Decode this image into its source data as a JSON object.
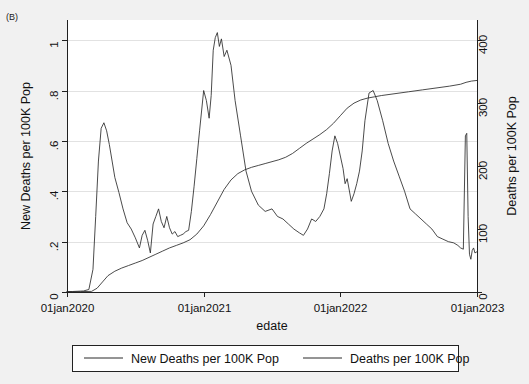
{
  "panel": {
    "tag": "(B)"
  },
  "colors": {
    "background": "#f1f1f1",
    "plot_area": "#ffffff",
    "axis": "#202020",
    "grid": "#e2e2e2",
    "series_new_deaths": "#2b2b2b",
    "series_cum_deaths": "#2b2b2b"
  },
  "legend": {
    "position": "bottom",
    "entries": [
      {
        "label": "New Deaths per 100K Pop",
        "key": "line"
      },
      {
        "label": "Deaths per 100K Pop",
        "key": "line"
      }
    ]
  },
  "chart_data": {
    "type": "line",
    "title": "",
    "subtitle": "",
    "xlabel": "edate",
    "ylabel": "New Deaths per 100K Pop",
    "y2label": "Deaths per 100K Pop",
    "grid": true,
    "legend_position": "bottom",
    "xlim": [
      "01jan2020",
      "01jan2023"
    ],
    "xtick_labels": [
      "01jan2020",
      "01jan2021",
      "01jan2022",
      "01jan2023"
    ],
    "xtick_values": [
      2020.0,
      2021.0,
      2022.0,
      2023.0
    ],
    "ylim": [
      0,
      1.08
    ],
    "ytick_labels": [
      "0",
      ".2",
      ".4",
      ".6",
      ".8",
      "1"
    ],
    "ytick_values": [
      0,
      0.2,
      0.4,
      0.6,
      0.8,
      1
    ],
    "y2lim": [
      0,
      432
    ],
    "y2tick_labels": [
      "0",
      "100",
      "200",
      "300",
      "400"
    ],
    "y2tick_values": [
      0,
      100,
      200,
      300,
      400
    ],
    "series": [
      {
        "name": "New Deaths per 100K Pop",
        "axis": "left",
        "units": "deaths per 100K population per day",
        "x": [
          2020.0,
          2020.04,
          2020.08,
          2020.12,
          2020.16,
          2020.19,
          2020.21,
          2020.23,
          2020.25,
          2020.27,
          2020.29,
          2020.31,
          2020.33,
          2020.35,
          2020.38,
          2020.41,
          2020.44,
          2020.47,
          2020.5,
          2020.53,
          2020.55,
          2020.57,
          2020.59,
          2020.61,
          2020.63,
          2020.65,
          2020.67,
          2020.69,
          2020.71,
          2020.73,
          2020.75,
          2020.77,
          2020.79,
          2020.81,
          2020.83,
          2020.85,
          2020.87,
          2020.89,
          2020.91,
          2020.93,
          2020.95,
          2020.97,
          2021.0,
          2021.02,
          2021.04,
          2021.055,
          2021.07,
          2021.085,
          2021.1,
          2021.115,
          2021.13,
          2021.15,
          2021.17,
          2021.2,
          2021.23,
          2021.27,
          2021.31,
          2021.35,
          2021.4,
          2021.45,
          2021.5,
          2021.54,
          2021.58,
          2021.62,
          2021.66,
          2021.7,
          2021.73,
          2021.76,
          2021.79,
          2021.82,
          2021.85,
          2021.88,
          2021.9,
          2021.92,
          2021.94,
          2021.96,
          2021.98,
          2022.0,
          2022.02,
          2022.035,
          2022.05,
          2022.065,
          2022.08,
          2022.1,
          2022.12,
          2022.14,
          2022.16,
          2022.18,
          2022.21,
          2022.24,
          2022.27,
          2022.31,
          2022.35,
          2022.39,
          2022.43,
          2022.47,
          2022.51,
          2022.55,
          2022.59,
          2022.63,
          2022.67,
          2022.71,
          2022.75,
          2022.79,
          2022.83,
          2022.86,
          2022.88,
          2022.9,
          2022.915,
          2022.925,
          2022.935,
          2022.945,
          2022.955,
          2022.965,
          2022.975,
          2022.985,
          2023.0
        ],
        "y": [
          0.002,
          0.002,
          0.003,
          0.004,
          0.01,
          0.09,
          0.3,
          0.52,
          0.65,
          0.672,
          0.64,
          0.585,
          0.52,
          0.455,
          0.395,
          0.33,
          0.275,
          0.25,
          0.215,
          0.175,
          0.225,
          0.245,
          0.205,
          0.155,
          0.27,
          0.3,
          0.33,
          0.28,
          0.255,
          0.3,
          0.255,
          0.23,
          0.24,
          0.22,
          0.225,
          0.23,
          0.24,
          0.245,
          0.32,
          0.42,
          0.53,
          0.64,
          0.8,
          0.76,
          0.69,
          0.78,
          0.96,
          1.01,
          1.03,
          0.975,
          1.005,
          0.935,
          0.96,
          0.9,
          0.76,
          0.62,
          0.48,
          0.4,
          0.345,
          0.32,
          0.33,
          0.3,
          0.29,
          0.27,
          0.25,
          0.235,
          0.225,
          0.25,
          0.29,
          0.28,
          0.3,
          0.33,
          0.39,
          0.47,
          0.56,
          0.62,
          0.59,
          0.54,
          0.49,
          0.43,
          0.45,
          0.405,
          0.36,
          0.39,
          0.43,
          0.48,
          0.56,
          0.68,
          0.79,
          0.8,
          0.76,
          0.68,
          0.59,
          0.52,
          0.46,
          0.4,
          0.33,
          0.31,
          0.29,
          0.27,
          0.25,
          0.22,
          0.21,
          0.2,
          0.195,
          0.185,
          0.175,
          0.17,
          0.62,
          0.63,
          0.3,
          0.15,
          0.13,
          0.165,
          0.175,
          0.155,
          0.16
        ]
      },
      {
        "name": "Deaths per 100K Pop",
        "axis": "right",
        "units": "cumulative deaths per 100K population",
        "x": [
          2020.0,
          2020.1,
          2020.18,
          2020.22,
          2020.26,
          2020.3,
          2020.35,
          2020.4,
          2020.45,
          2020.5,
          2020.55,
          2020.6,
          2020.65,
          2020.7,
          2020.75,
          2020.8,
          2020.85,
          2020.9,
          2020.95,
          2021.0,
          2021.05,
          2021.1,
          2021.15,
          2021.2,
          2021.25,
          2021.3,
          2021.35,
          2021.4,
          2021.45,
          2021.5,
          2021.55,
          2021.6,
          2021.65,
          2021.7,
          2021.75,
          2021.8,
          2021.85,
          2021.9,
          2021.95,
          2022.0,
          2022.05,
          2022.1,
          2022.15,
          2022.2,
          2022.25,
          2022.3,
          2022.4,
          2022.5,
          2022.6,
          2022.7,
          2022.8,
          2022.88,
          2022.92,
          2022.96,
          2023.0
        ],
        "y2": [
          0.4,
          0.6,
          1.0,
          6.0,
          16.0,
          26.0,
          33.0,
          38.0,
          42.0,
          46.0,
          50.0,
          55.0,
          60.0,
          65.0,
          70.0,
          74.0,
          78.0,
          83.0,
          92.0,
          105.0,
          123.0,
          143.0,
          163.0,
          178.0,
          188.0,
          194.0,
          198.0,
          201.0,
          204.0,
          207.0,
          210.0,
          214.0,
          220.0,
          228.0,
          236.0,
          243.0,
          250.0,
          258.0,
          268.0,
          280.0,
          292.0,
          300.0,
          305.0,
          308.0,
          310.0,
          312.0,
          315.0,
          318.0,
          321.0,
          324.0,
          327.0,
          330.0,
          333.0,
          335.0,
          336.0
        ]
      }
    ]
  }
}
